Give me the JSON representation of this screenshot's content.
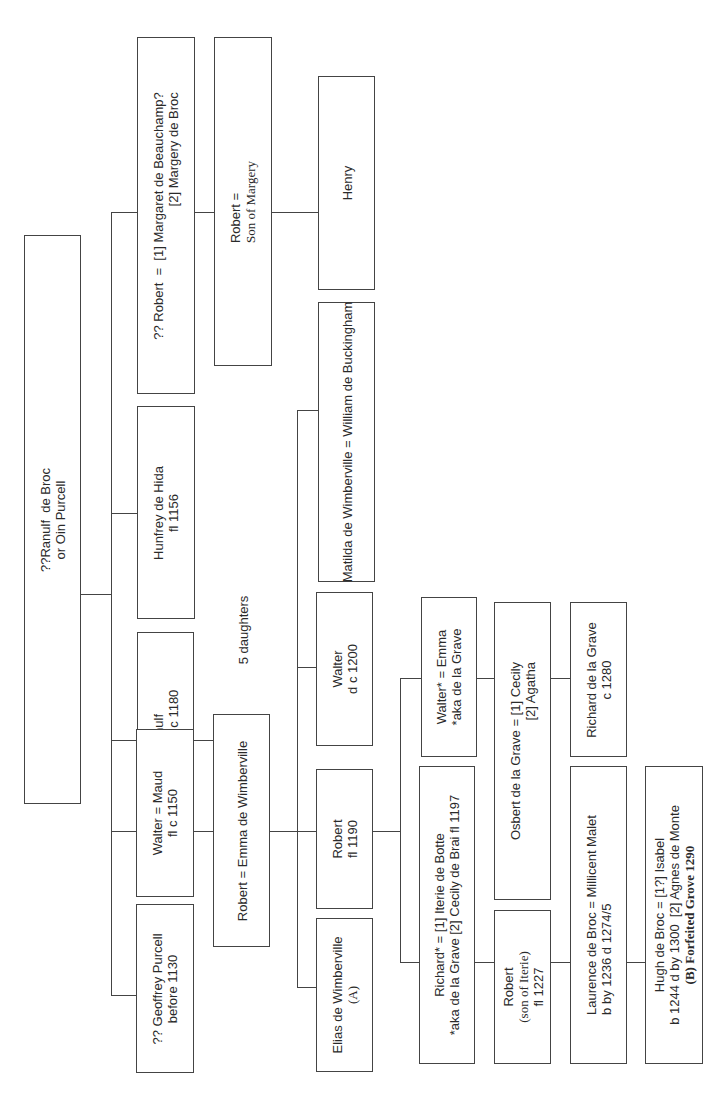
{
  "diagram": {
    "type": "family-tree",
    "orientation": "rotated-90",
    "nodes": {
      "root": {
        "line1": "??Ranulf  de Broc",
        "line2": "or Oin Purcell"
      },
      "geoffrey": {
        "line1": "?? Geoffrey Purcell",
        "line2": "before 1130"
      },
      "walter_maud": {
        "line1": "Walter = Maud",
        "line2": "fl c 1150"
      },
      "ranulf": {
        "line1": "??Ranulf",
        "line2": "fl c 1165 – c 1180"
      },
      "hunfrey": {
        "line1": "Hunfrey de Hida",
        "line2": "fl 1156"
      },
      "robert_q": {
        "line1": "?? Robert  =  [1] Margaret de Beauchamp?",
        "line2": "[2] Margery de Broc"
      },
      "five_daughters": {
        "label": "5 daughters"
      },
      "robert_emma": {
        "line1": "Robert = Emma de Wimberville"
      },
      "robert_son_margery": {
        "line1": "Robert =",
        "line2": "Son of Margery"
      },
      "elias": {
        "line1": "Elias de Wimberville",
        "line2": "(A)"
      },
      "robert_1190": {
        "line1": "Robert",
        "line2": "fl 1190"
      },
      "walter_1200": {
        "line1": "Walter",
        "line2": "d c 1200"
      },
      "matilda": {
        "line1": "Matilda de Wimberville = William de Buckingham"
      },
      "henry": {
        "line1": "Henry"
      },
      "richard": {
        "line1": "Richard* = [1] Iterie de Botte",
        "line2": "*aka de la Grave [2] Cecily de Brai fl 1197"
      },
      "walter_emma": {
        "line1": "Walter* = Emma",
        "line2": "*aka de la Grave"
      },
      "robert_iterie": {
        "line1": "Robert",
        "line2": "(son of Iterie)",
        "line3": "fl 1227"
      },
      "osbert": {
        "line1": "Osbert de la Grave = [1] Cecily",
        "line2": "[2] Agatha"
      },
      "laurence": {
        "line1": "Laurence de Broc = Millicent Malet",
        "line2": "b by 1236 d 1274/5"
      },
      "richard_grave": {
        "line1": "Richard de la Grave",
        "line2": "c 1280"
      },
      "hugh": {
        "line1": "Hugh de Broc = [1?] Isabel",
        "line2": "b 1244 d by 1300  [2] Agnes de Monte",
        "line3": "(B) Forfeited Grove 1290"
      }
    }
  }
}
